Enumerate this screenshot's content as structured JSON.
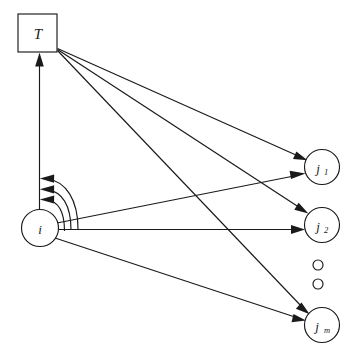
{
  "diagram": {
    "background_color": "#ffffff",
    "stroke_color": "#1a1a1a",
    "canvas": {
      "width": 358,
      "height": 360
    },
    "nodes": [
      {
        "id": "T",
        "label": "T",
        "subscript": "",
        "shape": "square",
        "x": 37.5,
        "y": 33,
        "size": 39,
        "name": "node-T"
      },
      {
        "id": "i",
        "label": "i",
        "subscript": "",
        "shape": "circle",
        "x": 40,
        "y": 228,
        "r": 18.5,
        "name": "node-i"
      },
      {
        "id": "j1",
        "label": "j",
        "subscript": "1",
        "shape": "circle",
        "x": 322,
        "y": 167,
        "r": 17.5,
        "name": "node-j1"
      },
      {
        "id": "j2",
        "label": "j",
        "subscript": "2",
        "shape": "circle",
        "x": 322,
        "y": 225,
        "r": 17.5,
        "name": "node-j2"
      },
      {
        "id": "jm",
        "label": "j",
        "subscript": "m",
        "shape": "circle",
        "x": 322,
        "y": 325,
        "r": 17.5,
        "name": "node-jm"
      }
    ],
    "ellipsis_dots": [
      {
        "x": 318,
        "y": 265,
        "r": 5,
        "name": "ellipsis-dot-1"
      },
      {
        "x": 318,
        "y": 284,
        "r": 5,
        "name": "ellipsis-dot-2"
      }
    ],
    "edges": [
      {
        "id": "T-j1",
        "from": "T",
        "to": "j1",
        "style": "straight",
        "arrow": "to",
        "name": "edge-T-to-j1"
      },
      {
        "id": "T-j2",
        "from": "T",
        "to": "j2",
        "style": "straight",
        "arrow": "to",
        "name": "edge-T-to-j2"
      },
      {
        "id": "T-jm",
        "from": "T",
        "to": "jm",
        "style": "straight",
        "arrow": "to",
        "name": "edge-T-to-jm"
      },
      {
        "id": "i-j1",
        "from": "i",
        "to": "j1",
        "style": "straight",
        "arrow": "to",
        "name": "edge-i-to-j1"
      },
      {
        "id": "i-j2",
        "from": "i",
        "to": "j2",
        "style": "straight",
        "arrow": "to",
        "name": "edge-i-to-j2"
      },
      {
        "id": "i-jm",
        "from": "i",
        "to": "jm",
        "style": "straight",
        "arrow": "to",
        "name": "edge-i-to-jm"
      },
      {
        "id": "i-T",
        "from": "i",
        "to": "T",
        "style": "vertical",
        "arrow": "to",
        "name": "edge-i-to-T"
      },
      {
        "id": "fb-1",
        "from": "i",
        "to": "i-T-line",
        "style": "arc",
        "arrow": "to",
        "name": "feedback-arc-1"
      },
      {
        "id": "fb-2",
        "from": "i",
        "to": "i-T-line",
        "style": "arc",
        "arrow": "to",
        "name": "feedback-arc-2"
      },
      {
        "id": "fb-3",
        "from": "i",
        "to": "i-T-line",
        "style": "arc",
        "arrow": "to",
        "name": "feedback-arc-3"
      }
    ]
  }
}
